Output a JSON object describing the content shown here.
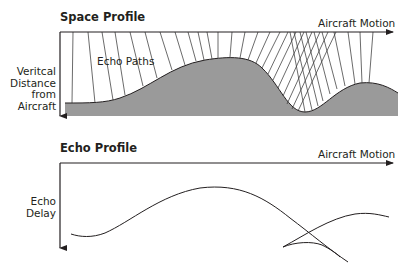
{
  "space_profile": {
    "title": "Space Profile",
    "x_axis_label": "Aircraft Motion",
    "y_axis_label_lines": [
      "Veritcal",
      "Distance",
      "from",
      "Aircraft"
    ],
    "annotation": "Echo Paths"
  },
  "echo_profile": {
    "title": "Echo Profile",
    "x_axis_label": "Aircraft Motion",
    "y_axis_label_lines": [
      "Echo",
      "Delay"
    ]
  },
  "colors": {
    "line": "#231f20",
    "terrain_fill": "#9a9a9a",
    "path_line": "#3a3a3a",
    "background": "#ffffff"
  }
}
